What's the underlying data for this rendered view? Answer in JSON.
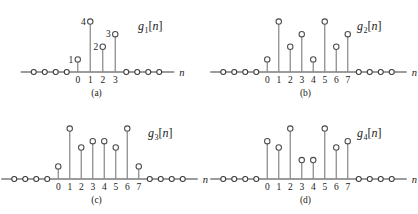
{
  "figure": {
    "axis_label": "n",
    "colors": {
      "stem": "#8a8a8a",
      "marker_stroke": "#4a4a4a",
      "axis": "#3a3a3a",
      "text": "#1a1a1a",
      "background": "#ffffff"
    }
  },
  "chart_data": [
    {
      "type": "stem",
      "id": "g1",
      "label_base": "g",
      "label_sub": "1",
      "label_arg": "[n]",
      "caption": "(a)",
      "xlabel": "n",
      "ylabel": "",
      "x": [
        0,
        1,
        2,
        3
      ],
      "values": [
        1,
        4,
        2,
        3
      ],
      "value_labels": [
        "1",
        "4",
        "2",
        "3"
      ],
      "show_value_labels": true,
      "tick_labels": [
        "0",
        "1",
        "2",
        "3"
      ],
      "zeros_left": 4,
      "zeros_right": 4,
      "ylim": [
        0,
        4.6
      ],
      "grid": false,
      "legend": "none"
    },
    {
      "type": "stem",
      "id": "g2",
      "label_base": "g",
      "label_sub": "2",
      "label_arg": "[n]",
      "caption": "(b)",
      "xlabel": "n",
      "ylabel": "",
      "x": [
        0,
        1,
        2,
        3,
        4,
        5,
        6,
        7
      ],
      "values": [
        1,
        4,
        2,
        3,
        1,
        4,
        2,
        3
      ],
      "value_labels": [],
      "show_value_labels": false,
      "tick_labels": [
        "0",
        "1",
        "2",
        "3",
        "4",
        "5",
        "6",
        "7"
      ],
      "zeros_left": 4,
      "zeros_right": 4,
      "ylim": [
        0,
        4.6
      ],
      "grid": false,
      "legend": "none"
    },
    {
      "type": "stem",
      "id": "g3",
      "label_base": "g",
      "label_sub": "3",
      "label_arg": "[n]",
      "caption": "(c)",
      "xlabel": "n",
      "ylabel": "",
      "x": [
        0,
        1,
        2,
        3,
        4,
        5,
        6,
        7
      ],
      "values": [
        1,
        4,
        2.5,
        3,
        3,
        2.5,
        4,
        1
      ],
      "value_labels": [],
      "show_value_labels": false,
      "tick_labels": [
        "0",
        "1",
        "2",
        "3",
        "4",
        "5",
        "6",
        "7"
      ],
      "zeros_left": 4,
      "zeros_right": 4,
      "ylim": [
        0,
        4.6
      ],
      "grid": false,
      "legend": "none"
    },
    {
      "type": "stem",
      "id": "g4",
      "label_base": "g",
      "label_sub": "4",
      "label_arg": "[n]",
      "caption": "(d)",
      "xlabel": "n",
      "ylabel": "",
      "x": [
        0,
        1,
        2,
        3,
        4,
        5,
        6,
        7
      ],
      "values": [
        3,
        2.5,
        4,
        1.5,
        1.5,
        4,
        2.5,
        3
      ],
      "value_labels": [],
      "show_value_labels": false,
      "tick_labels": [
        "0",
        "1",
        "2",
        "3",
        "4",
        "5",
        "6",
        "7"
      ],
      "zeros_left": 4,
      "zeros_right": 4,
      "ylim": [
        0,
        4.6
      ],
      "grid": false,
      "legend": "none"
    }
  ]
}
